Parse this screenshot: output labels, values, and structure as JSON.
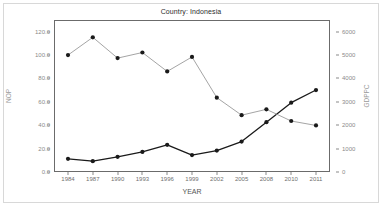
{
  "chart_data": {
    "type": "line",
    "title": "Country: Indonesia",
    "xlabel": "YEAR",
    "ylabel": "NOP",
    "ylabel_right": "GDPPC",
    "categories": [
      "1984",
      "1987",
      "1990",
      "1993",
      "1996",
      "1999",
      "2002",
      "2005",
      "2008",
      "2010",
      "2011"
    ],
    "x": [
      1984,
      1987,
      1990,
      1993,
      1996,
      1999,
      2002,
      2005,
      2008,
      2010,
      2011
    ],
    "ylim": [
      0.0,
      130.0
    ],
    "ylim_right": [
      0,
      6500
    ],
    "yticks": [
      "0.0",
      "20.0",
      "40.0",
      "60.0",
      "80.0",
      "100.0",
      "120.0"
    ],
    "ytick_values": [
      0,
      20,
      40,
      60,
      80,
      100,
      120
    ],
    "yticks_right": [
      "0",
      "1000",
      "2000",
      "3000",
      "4000",
      "5000",
      "6000"
    ],
    "ytick_right_values": [
      0,
      1000,
      2000,
      3000,
      4000,
      5000,
      6000
    ],
    "grid": false,
    "legend": "none",
    "series": [
      {
        "name": "NOP",
        "axis": "left",
        "color": "#1a1a1a",
        "marker": "circle",
        "values": [
          11.3,
          9.3,
          13.0,
          17.2,
          23.2,
          14.5,
          18.3,
          26.0,
          42.6,
          59.3,
          70.1
        ]
      },
      {
        "name": "GDPPC",
        "axis": "right",
        "color": "#9a9a9a",
        "marker": "circle",
        "values": [
          5000,
          5760,
          4870,
          5110,
          4300,
          4920,
          3180,
          2430,
          2680,
          2180,
          1990
        ]
      }
    ]
  }
}
